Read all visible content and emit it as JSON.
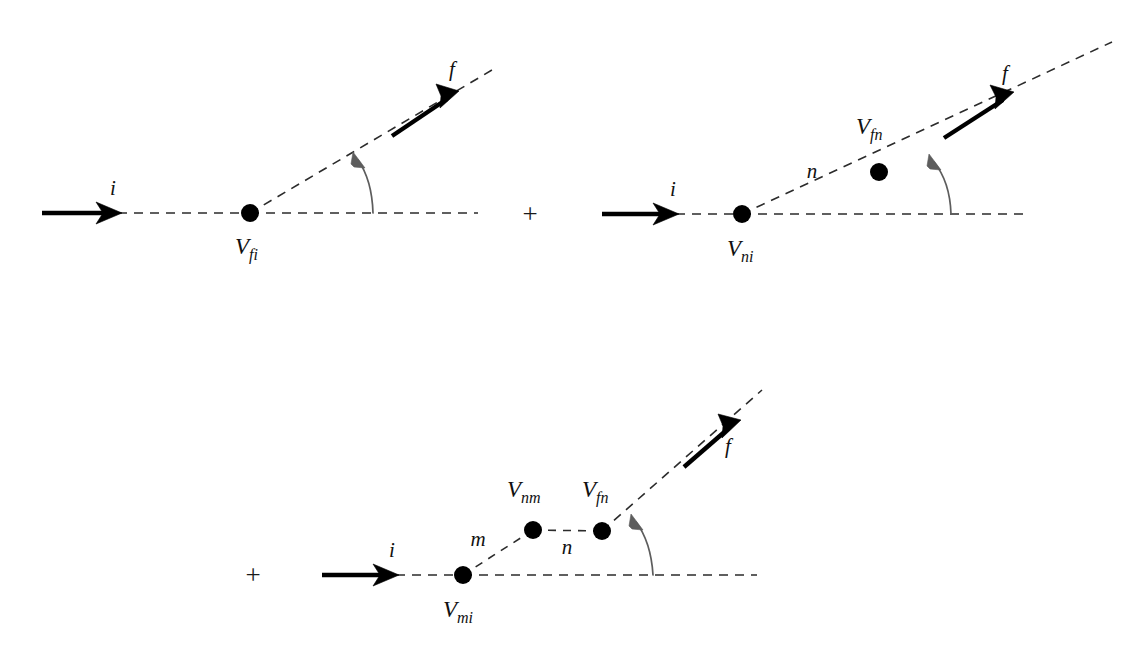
{
  "figure": {
    "background_color": "#ffffff",
    "line_color": "#2b2b2b",
    "arc_color": "#5d5d5d",
    "dot_color": "#000000",
    "width": 1148,
    "height": 655
  },
  "operators": {
    "plus_1": "+",
    "plus_2": "+"
  },
  "diagram1": {
    "name": "first-order-term",
    "incoming_label": "i",
    "outgoing_label": "f",
    "vertex_label_base": "V",
    "vertex_label_sub": "fi",
    "vertex_label_full": "V_fi"
  },
  "diagram2": {
    "name": "second-order-term",
    "incoming_label": "i",
    "intermediate_label": "n",
    "outgoing_label": "f",
    "vertex1_label_base": "V",
    "vertex1_label_sub": "ni",
    "vertex1_label_full": "V_ni",
    "vertex2_label_base": "V",
    "vertex2_label_sub": "fn",
    "vertex2_label_full": "V_fn"
  },
  "diagram3": {
    "name": "third-order-term",
    "incoming_label": "i",
    "intermediate_label_m": "m",
    "intermediate_label_n": "n",
    "outgoing_label": "f",
    "vertex1_label_base": "V",
    "vertex1_label_sub": "mi",
    "vertex1_label_full": "V_mi",
    "vertex2_label_base": "V",
    "vertex2_label_sub": "nm",
    "vertex2_label_full": "V_nm",
    "vertex3_label_base": "V",
    "vertex3_label_sub": "fn",
    "vertex3_label_full": "V_fn"
  }
}
